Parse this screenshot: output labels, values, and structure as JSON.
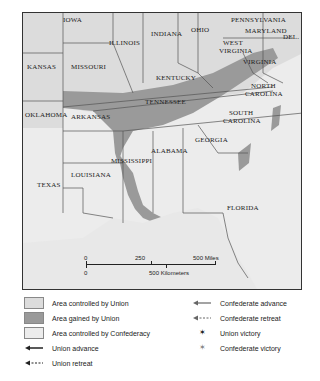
{
  "map": {
    "states": {
      "iowa": "IOWA",
      "illinois": "ILLINOIS",
      "indiana": "INDIANA",
      "ohio": "OHIO",
      "pennsylvania": "PENNSYLVANIA",
      "maryland": "MARYLAND",
      "delaware": "DEL.",
      "kansas": "KANSAS",
      "missouri": "MISSOURI",
      "west_virginia_1": "WEST",
      "west_virginia_2": "VIRGINIA",
      "virginia": "VIRGINIA",
      "kentucky": "KENTUCKY",
      "tennessee": "TENNESSEE",
      "north_carolina_1": "NORTH",
      "north_carolina_2": "CAROLINA",
      "oklahoma": "OKLAHOMA",
      "arkansas": "ARKANSAS",
      "south_carolina_1": "SOUTH",
      "south_carolina_2": "CAROLINA",
      "georgia": "GEORGIA",
      "alabama": "ALABAMA",
      "mississippi": "MISSISSIPPI",
      "louisiana": "LOUISIANA",
      "texas": "TEXAS",
      "florida": "FLORIDA"
    },
    "scale": {
      "miles_zero": "0",
      "miles_mid": "250",
      "miles_end": "500 Miles",
      "km_zero": "0",
      "km_end": "500 Kilometers"
    },
    "colors": {
      "union_area": "#dcdcdc",
      "gained_area": "#9a9a9a",
      "confederacy_area": "#ececec",
      "border": "#555555"
    }
  },
  "legend": {
    "union_controlled": "Area controlled by Union",
    "union_gained": "Area gained by Union",
    "confederacy_controlled": "Area controlled by Confederacy",
    "union_advance": "Union advance",
    "union_retreat": "Union retreat",
    "confederate_advance": "Confederate advance",
    "confederate_retreat": "Confederate retreat",
    "union_victory": "Union victory",
    "confederate_victory": "Confederate victory"
  }
}
